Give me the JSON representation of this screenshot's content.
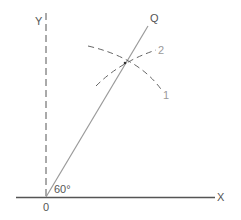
{
  "diagram": {
    "type": "geometric-construction",
    "labels": {
      "y_axis": "Y",
      "x_axis": "X",
      "origin": "0",
      "ray": "Q",
      "angle": "60°",
      "arc1": "1",
      "arc2": "2"
    },
    "angle_degrees": 60,
    "colors": {
      "axis": "#555555",
      "ray": "#9a9a9a",
      "arc": "#666666",
      "label_light": "#9a9a9a"
    },
    "geometry": {
      "origin": [
        46,
        197
      ],
      "x_axis": {
        "from": [
          16,
          197
        ],
        "to": [
          215,
          197
        ]
      },
      "y_axis_dashed": {
        "from": [
          46,
          13
        ],
        "to": [
          46,
          197
        ]
      },
      "ray_OQ": {
        "from": [
          46,
          197
        ],
        "to": [
          148,
          26
        ]
      },
      "intersection": [
        125,
        63
      ]
    }
  }
}
